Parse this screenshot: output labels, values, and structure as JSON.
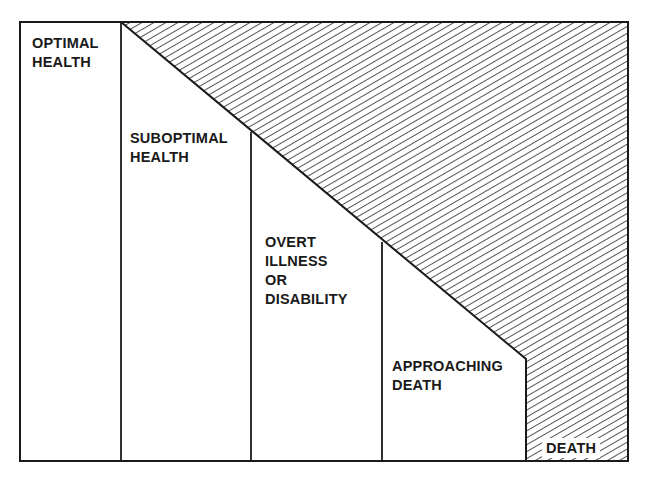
{
  "diagram": {
    "type": "health-continuum",
    "stages": [
      {
        "id": "optimal",
        "label": "OPTIMAL\nHEALTH"
      },
      {
        "id": "suboptimal",
        "label": "SUBOPTIMAL\nHEALTH"
      },
      {
        "id": "overt",
        "label": "OVERT\nILLNESS\nOR\nDISABILITY"
      },
      {
        "id": "approaching",
        "label": "APPROACHING\nDEATH"
      },
      {
        "id": "death",
        "label": "DEATH"
      }
    ],
    "colors": {
      "line": "#1a1a1a",
      "hatch": "#2a2a2a",
      "background": "#ffffff"
    }
  }
}
